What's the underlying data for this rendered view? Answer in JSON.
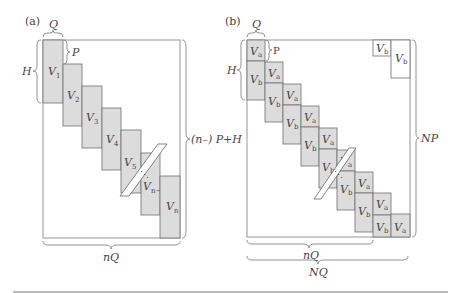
{
  "figure": {
    "panel_a": {
      "label": "(a)",
      "top_brace": "Q",
      "step_brace": "P",
      "left_brace": "H",
      "right_brace": "(n–) P+H",
      "bottom_brace": "nQ",
      "blocks": [
        {
          "name": "V",
          "sub": "1"
        },
        {
          "name": "V",
          "sub": "2"
        },
        {
          "name": "V",
          "sub": "3"
        },
        {
          "name": "V",
          "sub": "4"
        },
        {
          "name": "V",
          "sub": "5"
        },
        {
          "name": "V",
          "sub": "n−1"
        },
        {
          "name": "V",
          "sub": "n"
        }
      ],
      "ellipsis": "⋱"
    },
    "panel_b": {
      "label": "(b)",
      "top_brace": "Q",
      "step_brace": "P",
      "left_brace": "H",
      "right_brace": "NP",
      "bottom_brace_inner": "nQ",
      "bottom_brace_outer": "NQ",
      "block_a": {
        "name": "V",
        "sub": "a"
      },
      "block_b": {
        "name": "V",
        "sub": "b"
      },
      "corner_blocks": [
        {
          "name": "V",
          "sub": "b"
        },
        {
          "name": "V",
          "sub": "b"
        }
      ],
      "ellipsis": "⋱"
    },
    "colors": {
      "block_fill": "#dcdcdc",
      "line": "#6e6e6e",
      "background": "#ffffff"
    }
  }
}
